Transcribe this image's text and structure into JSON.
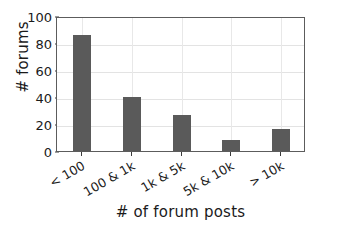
{
  "chart_data": {
    "type": "bar",
    "title": "",
    "xlabel": "# of forum posts",
    "ylabel": "# forums",
    "categories": [
      "< 100",
      "100 & 1k",
      "1k & 5k",
      "5k & 10k",
      "> 10k"
    ],
    "values": [
      86,
      40,
      27,
      8,
      16
    ],
    "ylim": [
      0,
      100
    ],
    "yticks": [
      0,
      20,
      40,
      60,
      80,
      100
    ],
    "ytick_labels": [
      "0",
      "20",
      "40",
      "60",
      "80",
      "100"
    ],
    "grid": true,
    "grid_axis": "both",
    "legend": "none",
    "bar_color": "#5a5a5a",
    "grid_color": "#e3e3e3",
    "axis_color": "#5c5c5c",
    "background": "#ffffff",
    "xtick_label_rotation": -30,
    "series": [
      {
        "name": "# forums",
        "values": [
          86,
          40,
          27,
          8,
          16
        ]
      }
    ]
  }
}
